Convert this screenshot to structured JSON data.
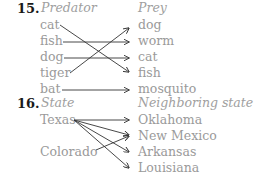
{
  "problems": [
    {
      "number": "15.",
      "left_header": "Predator",
      "right_header": "Prey",
      "left_items": [
        "cat",
        "fish",
        "dog",
        "tiger",
        "bat"
      ],
      "right_items": [
        "dog",
        "worm",
        "cat",
        "fish",
        "mosquito"
      ],
      "mappings": [
        [
          "cat",
          "fish"
        ],
        [
          "fish",
          "worm"
        ],
        [
          "dog",
          "cat"
        ],
        [
          "tiger",
          "dog"
        ],
        [
          "bat",
          "mosquito"
        ]
      ]
    },
    {
      "number": "16.",
      "left_header": "State",
      "right_header": "Neighboring state",
      "left_items": [
        "Texas",
        "Colorado"
      ],
      "right_items": [
        "Oklahoma",
        "New Mexico",
        "Arkansas",
        "Louisiana"
      ],
      "mappings": [
        [
          "Texas",
          "Oklahoma"
        ],
        [
          "Texas",
          "New Mexico"
        ],
        [
          "Texas",
          "Arkansas"
        ],
        [
          "Texas",
          "Louisiana"
        ],
        [
          "Colorado",
          "New Mexico"
        ]
      ]
    }
  ],
  "colors": {
    "text_gray": "#9a9a9a",
    "arrow": "#333333",
    "number": "#1a1a1a"
  }
}
